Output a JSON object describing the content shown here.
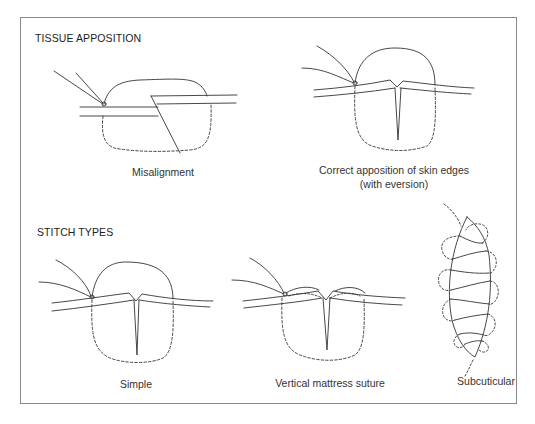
{
  "sections": {
    "tissue_apposition": {
      "heading": "TISSUE APPOSITION",
      "panels": [
        {
          "id": "misalignment",
          "caption": "Misalignment"
        },
        {
          "id": "correct",
          "caption_line1": "Correct apposition of skin edges",
          "caption_line2": "(with eversion)"
        }
      ]
    },
    "stitch_types": {
      "heading": "STITCH TYPES",
      "panels": [
        {
          "id": "simple",
          "caption": "Simple"
        },
        {
          "id": "vertical_mattress",
          "caption": "Vertical mattress suture"
        },
        {
          "id": "subcuticular",
          "caption": "Subcuticular"
        }
      ]
    }
  },
  "colors": {
    "line": "#333333",
    "frame": "#8a8a8a",
    "background": "#ffffff"
  }
}
